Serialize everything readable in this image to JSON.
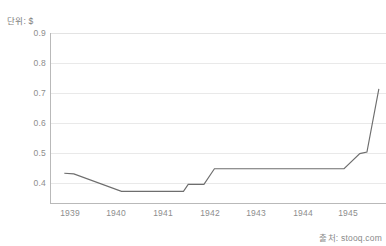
{
  "chart_title_partial": "",
  "unit_label": "단위: $",
  "source_label": "출처: stooq.com",
  "axis": {
    "y_ticks": [
      "0.9",
      "0.8",
      "0.7",
      "0.6",
      "0.5",
      "0.4"
    ],
    "x_ticks": [
      "1939",
      "1940",
      "1941",
      "1942",
      "1943",
      "1944",
      "1945"
    ]
  },
  "colors": {
    "line": "#6e6e6e",
    "grid": "#e9e9e9",
    "axis": "#b9b9b9",
    "text": "#8d8d8d",
    "background": "#ffffff"
  },
  "chart_data": {
    "type": "line",
    "title": "",
    "xlabel": "",
    "ylabel": "단위: $",
    "source": "출처: stooq.com",
    "grid": true,
    "legend": "none",
    "xlim": [
      1938.55,
      1945.6
    ],
    "ylim": [
      0.333,
      0.9
    ],
    "yticks": [
      0.4,
      0.5,
      0.6,
      0.7,
      0.8,
      0.9
    ],
    "xticks": [
      1939,
      1940,
      1941,
      1942,
      1943,
      1944,
      1945
    ],
    "series": [
      {
        "name": "Price",
        "x": [
          1938.85,
          1939.05,
          1940.05,
          1941.35,
          1941.45,
          1941.78,
          1942.0,
          1944.45,
          1944.72,
          1945.05,
          1945.2,
          1945.45
        ],
        "values": [
          0.435,
          0.433,
          0.375,
          0.375,
          0.398,
          0.398,
          0.45,
          0.45,
          0.45,
          0.5,
          0.505,
          0.715
        ]
      }
    ]
  }
}
